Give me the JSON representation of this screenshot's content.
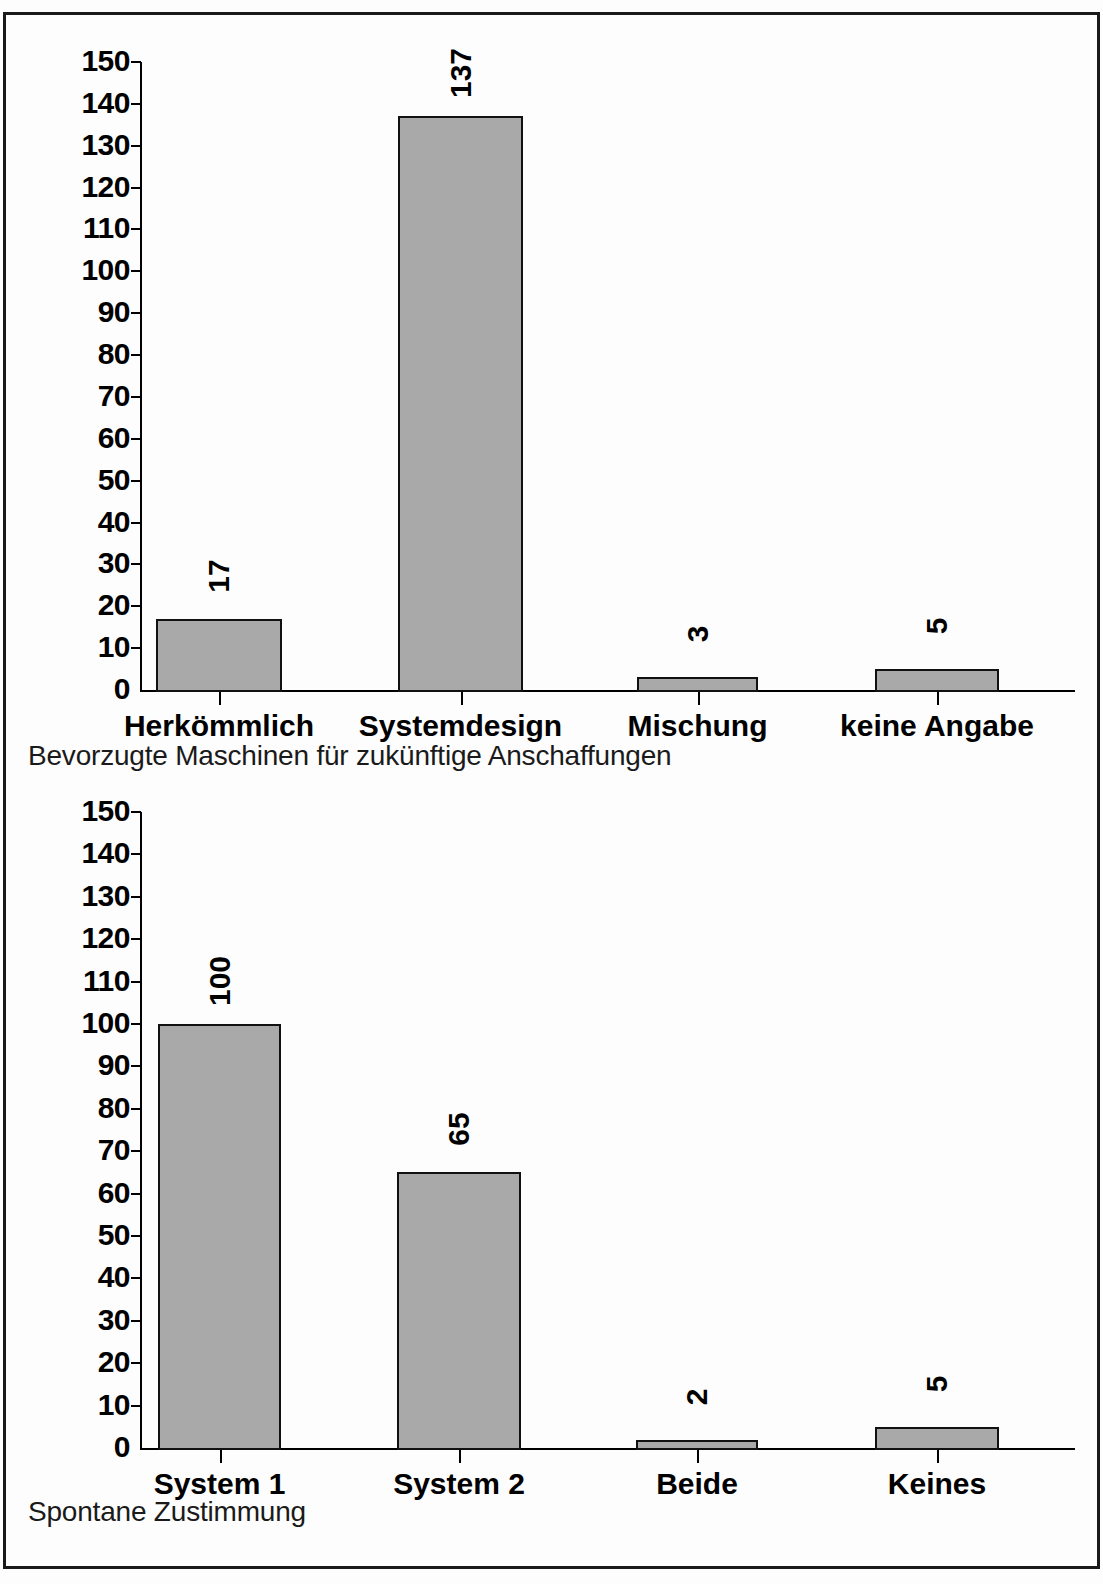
{
  "page": {
    "background_color": "#ffffff",
    "border_color": "#1a1a1a",
    "bar_fill_color": "#a9a9a9",
    "bar_edge_color": "#111111"
  },
  "charts": [
    {
      "id": "chart-top",
      "caption": "Bevorzugte Maschinen für zukünftige Anschaffungen",
      "y_ticks": [
        "150",
        "140",
        "130",
        "120",
        "110",
        "100",
        "90",
        "80",
        "70",
        "60",
        "50",
        "40",
        "30",
        "20",
        "10",
        "0"
      ],
      "categories": [
        "Herkömmlich",
        "Systemdesign",
        "Mischung",
        "keine Angabe"
      ],
      "values": [
        "17",
        "137",
        "3",
        "5"
      ]
    },
    {
      "id": "chart-bottom",
      "caption": "Spontane Zustimmung",
      "y_ticks": [
        "150",
        "140",
        "130",
        "120",
        "110",
        "100",
        "90",
        "80",
        "70",
        "60",
        "50",
        "40",
        "30",
        "20",
        "10",
        "0"
      ],
      "categories": [
        "System 1",
        "System 2",
        "Beide",
        "Keines"
      ],
      "values": [
        "100",
        "65",
        "2",
        "5"
      ]
    }
  ],
  "chart_data": [
    {
      "type": "bar",
      "title": "Bevorzugte Maschinen für zukünftige Anschaffungen",
      "xlabel": "",
      "ylabel": "",
      "categories": [
        "Herkömmlich",
        "Systemdesign",
        "Mischung",
        "keine Angabe"
      ],
      "values": [
        17,
        137,
        3,
        5
      ],
      "ylim": [
        0,
        150
      ],
      "ytick_step": 10,
      "grid": false,
      "legend": "none",
      "data_labels": true,
      "data_label_rotation": -90
    },
    {
      "type": "bar",
      "title": "Spontane Zustimmung",
      "xlabel": "",
      "ylabel": "",
      "categories": [
        "System 1",
        "System 2",
        "Beide",
        "Keines"
      ],
      "values": [
        100,
        65,
        2,
        5
      ],
      "ylim": [
        0,
        150
      ],
      "ytick_step": 10,
      "grid": false,
      "legend": "none",
      "data_labels": true,
      "data_label_rotation": -90
    }
  ]
}
